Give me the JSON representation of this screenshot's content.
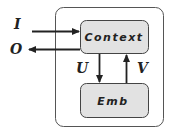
{
  "diagram": {
    "outer_container": {
      "label": ""
    },
    "boxes": {
      "context": {
        "label": "Context"
      },
      "emb": {
        "label": "Emb"
      }
    },
    "arrows": {
      "input": {
        "label": "I",
        "from": "external",
        "to": "Context"
      },
      "output": {
        "label": "O",
        "from": "Context",
        "to": "external"
      },
      "u": {
        "label": "U",
        "from": "Context",
        "to": "Emb"
      },
      "v": {
        "label": "V",
        "from": "Emb",
        "to": "Context"
      }
    },
    "colors": {
      "box_fill": "#e2e2e2",
      "stroke": "#222222",
      "outer_stroke": "#555555"
    }
  }
}
